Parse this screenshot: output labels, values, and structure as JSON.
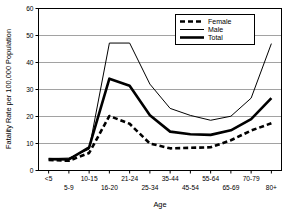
{
  "chart_data": {
    "type": "line",
    "title": "",
    "xlabel": "Age",
    "ylabel": "Fatality Rate per 100,000 Population",
    "categories": [
      "<5",
      "5-9",
      "10-15",
      "16-20",
      "21-24",
      "25-34",
      "35-44",
      "45-54",
      "55-64",
      "65-69",
      "70-79",
      "80+"
    ],
    "ylim": [
      0,
      60
    ],
    "yticks": [
      0,
      10,
      20,
      30,
      40,
      50,
      60
    ],
    "ytick_labels": [
      "0",
      "10",
      "20",
      "30",
      "40",
      "50",
      "60"
    ],
    "grid": "horizontal",
    "legend_position": "top-right",
    "series": [
      {
        "name": "Female",
        "style": "dashed",
        "color": "#000000",
        "values": [
          3.9,
          3.6,
          6.5,
          20.2,
          17.3,
          10.0,
          8.2,
          8.4,
          8.6,
          11.2,
          14.8,
          17.5
        ]
      },
      {
        "name": "Male",
        "style": "thin-solid",
        "color": "#000000",
        "values": [
          4.4,
          4.6,
          7.9,
          47.2,
          47.2,
          32.0,
          23.0,
          20.4,
          18.6,
          20.1,
          26.8,
          47.0
        ]
      },
      {
        "name": "Total",
        "style": "thick-solid",
        "color": "#000000",
        "values": [
          4.2,
          4.1,
          8.6,
          34.0,
          31.4,
          20.5,
          14.4,
          13.4,
          13.2,
          14.9,
          19.0,
          26.8
        ]
      }
    ]
  },
  "legend": {
    "items": [
      {
        "label": "Female"
      },
      {
        "label": "Male"
      },
      {
        "label": "Total"
      }
    ]
  },
  "axes": {
    "x_title": "Age",
    "y_title": "Fatality Rate per 100,000 Population"
  }
}
